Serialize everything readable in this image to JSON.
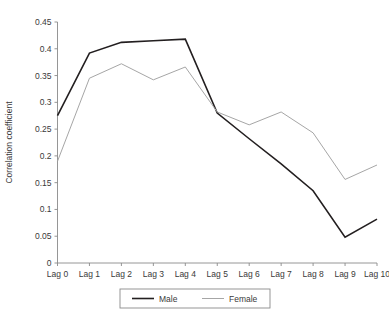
{
  "chart_data": {
    "type": "line",
    "title": "",
    "xlabel": "",
    "ylabel": "Correlation coefficient",
    "categories": [
      "Lag 0",
      "Lag 1",
      "Lag 2",
      "Lag 3",
      "Lag 4",
      "Lag 5",
      "Lag 6",
      "Lag 7",
      "Lag 8",
      "Lag 9",
      "Lag 10"
    ],
    "ylim": [
      0,
      0.45
    ],
    "yticks": [
      0,
      0.05,
      0.1,
      0.15,
      0.2,
      0.25,
      0.3,
      0.35,
      0.4,
      0.45
    ],
    "ytick_labels": [
      "0",
      "0.05",
      "0.1",
      "0.15",
      "0.2",
      "0.25",
      "0.3",
      "0.35",
      "0.4",
      "0.45"
    ],
    "grid": false,
    "legend_position": "bottom",
    "series": [
      {
        "name": "Male",
        "color": "#231f20",
        "values": [
          0.275,
          0.392,
          0.412,
          0.415,
          0.418,
          0.28,
          0.232,
          0.185,
          0.135,
          0.048,
          0.082
        ]
      },
      {
        "name": "Female",
        "color": "#a6a6a6",
        "values": [
          0.19,
          0.345,
          0.372,
          0.342,
          0.366,
          0.282,
          0.258,
          0.282,
          0.243,
          0.156,
          0.183
        ]
      }
    ]
  }
}
